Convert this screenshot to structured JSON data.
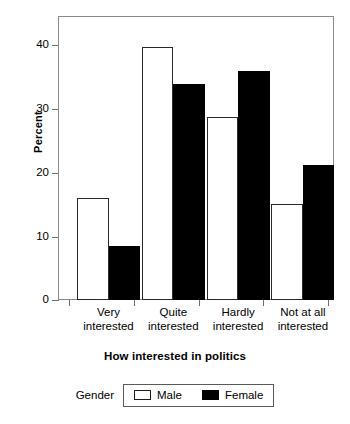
{
  "chart_data": {
    "type": "bar",
    "title": "",
    "xlabel": "How interested in politics",
    "ylabel": "Percent",
    "categories": [
      "Very interested",
      "Quite interested",
      "Hardly interested",
      "Not at all interested"
    ],
    "category_lines": [
      [
        "Very",
        "interested"
      ],
      [
        "Quite",
        "interested"
      ],
      [
        "Hardly",
        "interested"
      ],
      [
        "Not at all",
        "interested"
      ]
    ],
    "series": [
      {
        "name": "Male",
        "color": "#ffffff",
        "values": [
          16.0,
          39.8,
          28.8,
          15.0
        ]
      },
      {
        "name": "Female",
        "color": "#000000",
        "values": [
          8.5,
          34.0,
          36.0,
          21.2
        ]
      }
    ],
    "ylim": [
      0,
      44.6
    ],
    "yticks": [
      0,
      10,
      20,
      30,
      40
    ],
    "ytick_labels": [
      "0",
      "10",
      "20",
      "30",
      "40"
    ],
    "grid": false,
    "legend_position": "bottom",
    "legend_title": "Gender"
  },
  "axes": {
    "y_title": "Percent",
    "x_title": "How interested in politics",
    "y_labels": [
      "40",
      "30",
      "20",
      "10",
      "0"
    ]
  },
  "legend": {
    "title": "Gender",
    "entries": [
      {
        "label": "Male"
      },
      {
        "label": "Female"
      }
    ]
  }
}
